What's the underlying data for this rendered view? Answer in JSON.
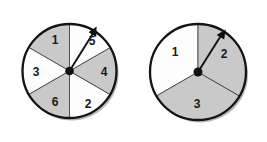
{
  "figure": {
    "background_color": "#ffffff",
    "shaded_color": "#c9c9c9",
    "unshaded_color": "#fdfdfd",
    "outline_color": "#141414",
    "divider_color": "#3a3a3a",
    "shadow_color": "#b8b8b8",
    "pointer_color": "#101010",
    "hub_color": "#101010"
  },
  "spinners": [
    {
      "id": "spinner-left",
      "name": "six-sector-spinner",
      "center": {
        "x": 69.5,
        "y": 71
      },
      "radius": 47,
      "sector_count": 6,
      "pointer_angle_deg": 70,
      "pointer_points_to": "5",
      "sectors": [
        {
          "label": "1",
          "shaded": true,
          "start_deg": 90,
          "end_deg": 150,
          "label_x": 55,
          "label_y": 40
        },
        {
          "label": "5",
          "shaded": false,
          "start_deg": 30,
          "end_deg": 90,
          "label_x": 92,
          "label_y": 41
        },
        {
          "label": "4",
          "shaded": true,
          "start_deg": 330,
          "end_deg": 30,
          "label_x": 104,
          "label_y": 72
        },
        {
          "label": "2",
          "shaded": false,
          "start_deg": 270,
          "end_deg": 330,
          "label_x": 88,
          "label_y": 104
        },
        {
          "label": "6",
          "shaded": true,
          "start_deg": 210,
          "end_deg": 270,
          "label_x": 55,
          "label_y": 102
        },
        {
          "label": "3",
          "shaded": false,
          "start_deg": 150,
          "end_deg": 210,
          "label_x": 36,
          "label_y": 72
        }
      ]
    },
    {
      "id": "spinner-right",
      "name": "three-sector-spinner",
      "center": {
        "x": 198,
        "y": 72
      },
      "radius": 48,
      "sector_count": 3,
      "pointer_angle_deg": 55,
      "pointer_points_to": "2",
      "sectors": [
        {
          "label": "1",
          "shaded": false,
          "start_deg": 90,
          "end_deg": 210,
          "label_x": 175,
          "label_y": 52
        },
        {
          "label": "2",
          "shaded": true,
          "start_deg": 330,
          "end_deg": 90,
          "label_x": 224,
          "label_y": 54
        },
        {
          "label": "3",
          "shaded": true,
          "start_deg": 210,
          "end_deg": 330,
          "label_x": 197,
          "label_y": 104
        }
      ]
    }
  ]
}
